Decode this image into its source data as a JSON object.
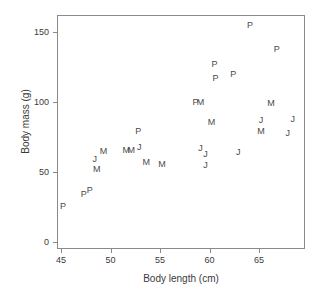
{
  "chart_data": {
    "type": "scatter",
    "title": "",
    "xlabel": "Body length (cm)",
    "ylabel": "Body mass (g)",
    "xlim": [
      44.0,
      69.0
    ],
    "ylim": [
      -8,
      163
    ],
    "xticks": [
      45,
      50,
      55,
      60,
      65
    ],
    "xticklabels": [
      "45",
      "50",
      "55",
      "60",
      "65"
    ],
    "yticks": [
      0,
      50,
      100,
      150
    ],
    "yticklabels": [
      "0",
      "50",
      "100",
      "150"
    ],
    "grid": false,
    "legend": "none",
    "marker_style": "text-letter",
    "series": [
      {
        "name": "P",
        "label": "P",
        "points": [
          {
            "x": 45.2,
            "y": 26,
            "label": "P"
          },
          {
            "x": 47.3,
            "y": 34,
            "label": "P"
          },
          {
            "x": 47.9,
            "y": 37,
            "label": "P"
          },
          {
            "x": 52.8,
            "y": 79,
            "label": "P"
          },
          {
            "x": 58.6,
            "y": 100,
            "label": "P"
          },
          {
            "x": 60.5,
            "y": 127,
            "label": "P"
          },
          {
            "x": 60.6,
            "y": 117,
            "label": "P"
          },
          {
            "x": 62.4,
            "y": 120,
            "label": "P"
          },
          {
            "x": 64.1,
            "y": 155,
            "label": "P"
          },
          {
            "x": 66.8,
            "y": 138,
            "label": "P"
          }
        ]
      },
      {
        "name": "M",
        "label": "M",
        "points": [
          {
            "x": 48.6,
            "y": 52,
            "label": "M"
          },
          {
            "x": 49.3,
            "y": 65,
            "label": "M"
          },
          {
            "x": 51.6,
            "y": 66,
            "label": "M"
          },
          {
            "x": 52.1,
            "y": 66,
            "label": "M"
          },
          {
            "x": 53.6,
            "y": 57,
            "label": "M"
          },
          {
            "x": 55.2,
            "y": 56,
            "label": "M"
          },
          {
            "x": 59.1,
            "y": 100,
            "label": "M"
          },
          {
            "x": 60.2,
            "y": 86,
            "label": "M"
          },
          {
            "x": 65.2,
            "y": 79,
            "label": "M"
          },
          {
            "x": 66.2,
            "y": 99,
            "label": "M"
          }
        ]
      },
      {
        "name": "J",
        "label": "J",
        "points": [
          {
            "x": 48.4,
            "y": 59,
            "label": "J"
          },
          {
            "x": 52.9,
            "y": 68,
            "label": "J"
          },
          {
            "x": 59.1,
            "y": 67,
            "label": "J"
          },
          {
            "x": 59.6,
            "y": 63,
            "label": "J"
          },
          {
            "x": 59.6,
            "y": 55,
            "label": "J"
          },
          {
            "x": 62.9,
            "y": 64,
            "label": "J"
          },
          {
            "x": 65.2,
            "y": 87,
            "label": "J"
          },
          {
            "x": 67.9,
            "y": 78,
            "label": "J"
          },
          {
            "x": 68.4,
            "y": 88,
            "label": "J"
          }
        ]
      }
    ]
  }
}
